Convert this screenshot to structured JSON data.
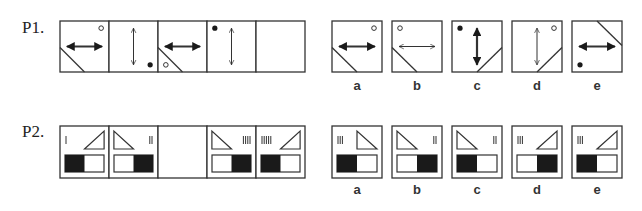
{
  "problems": [
    {
      "id": "P1",
      "label": "P1.",
      "sequence": [
        {
          "arrow": "horizontal-bold",
          "diag": "bottom-left",
          "dot": {
            "pos": "top-right",
            "fill": "open"
          }
        },
        {
          "arrow": "vertical-thin",
          "diag": "none",
          "dot": {
            "pos": "bottom-right",
            "fill": "filled"
          }
        },
        {
          "arrow": "horizontal-bold",
          "diag": "bottom-left",
          "dot": {
            "pos": "bottom-left",
            "fill": "open"
          }
        },
        {
          "arrow": "vertical-thin",
          "diag": "none",
          "dot": {
            "pos": "top-left",
            "fill": "filled"
          }
        },
        {
          "empty": true
        }
      ],
      "options": [
        {
          "label": "a",
          "arrow": "horizontal-bold",
          "diag": "bottom-left",
          "dot": {
            "pos": "top-right",
            "fill": "open"
          }
        },
        {
          "label": "b",
          "arrow": "horizontal-thin",
          "diag": "bottom-left",
          "dot": {
            "pos": "top-left",
            "fill": "open"
          }
        },
        {
          "label": "c",
          "arrow": "vertical-bold",
          "diag": "bottom-right",
          "dot": {
            "pos": "top-left",
            "fill": "filled"
          }
        },
        {
          "label": "d",
          "arrow": "vertical-thin",
          "diag": "bottom-right",
          "dot": {
            "pos": "top-right",
            "fill": "open"
          }
        },
        {
          "label": "e",
          "arrow": "horizontal-bold",
          "diag": "top-right",
          "dot": {
            "pos": "bottom-left",
            "fill": "filled"
          }
        }
      ]
    },
    {
      "id": "P2",
      "label": "P2.",
      "sequence": [
        {
          "tally": 1,
          "tally_side": "left",
          "triangle": "right-angle-right",
          "block": "left"
        },
        {
          "tally": 2,
          "tally_side": "right",
          "triangle": "right-angle-left",
          "block": "right"
        },
        {
          "empty": true
        },
        {
          "tally": 4,
          "tally_side": "right",
          "triangle": "right-angle-left",
          "block": "right"
        },
        {
          "tally": 5,
          "tally_side": "left",
          "triangle": "right-angle-right",
          "block": "left"
        }
      ],
      "options": [
        {
          "label": "a",
          "tally": 3,
          "tally_side": "left",
          "triangle": "right-angle-left",
          "block": "left"
        },
        {
          "label": "b",
          "tally": 2,
          "tally_side": "right",
          "triangle": "right-angle-left",
          "block": "right"
        },
        {
          "label": "c",
          "tally": 2,
          "tally_side": "right",
          "triangle": "right-angle-left",
          "block": "left"
        },
        {
          "label": "d",
          "tally": 3,
          "tally_side": "left",
          "triangle": "right-angle-right",
          "block": "right"
        },
        {
          "label": "e",
          "tally": 3,
          "tally_side": "left",
          "triangle": "right-angle-right",
          "block": "left"
        }
      ]
    }
  ],
  "colors": {
    "stroke": "#333333",
    "fill": "#1a1a1a",
    "background": "#ffffff"
  }
}
